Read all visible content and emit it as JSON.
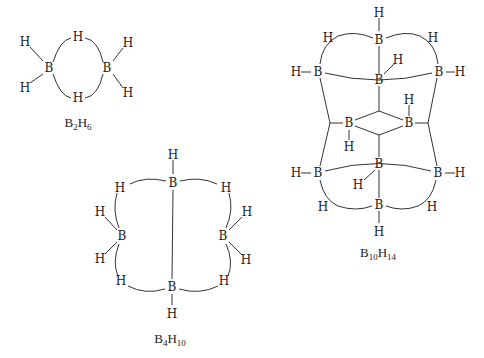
{
  "diagram": {
    "colors": {
      "ink": "#222222",
      "background": "#ffffff"
    },
    "molecules": [
      {
        "id": "b2h6",
        "formula": {
          "main1": "B",
          "sub1": "2",
          "main2": "H",
          "sub2": "6"
        },
        "atoms": [
          {
            "el": "B",
            "x": 49,
            "y": 68
          },
          {
            "el": "B",
            "x": 107,
            "y": 68
          },
          {
            "el": "H",
            "x": 78,
            "y": 37
          },
          {
            "el": "H",
            "x": 78,
            "y": 98
          },
          {
            "el": "H",
            "x": 25,
            "y": 42
          },
          {
            "el": "H",
            "x": 25,
            "y": 88
          },
          {
            "el": "H",
            "x": 128,
            "y": 43
          },
          {
            "el": "H",
            "x": 128,
            "y": 93
          }
        ]
      },
      {
        "id": "b4h10",
        "formula": {
          "main1": "B",
          "sub1": "4",
          "main2": "H",
          "sub2": "10"
        },
        "atoms": [
          {
            "el": "H",
            "x": 173,
            "y": 155
          },
          {
            "el": "B",
            "x": 173,
            "y": 183
          },
          {
            "el": "H",
            "x": 120,
            "y": 188
          },
          {
            "el": "H",
            "x": 226,
            "y": 188
          },
          {
            "el": "H",
            "x": 100,
            "y": 212
          },
          {
            "el": "B",
            "x": 122,
            "y": 236
          },
          {
            "el": "H",
            "x": 100,
            "y": 259
          },
          {
            "el": "H",
            "x": 247,
            "y": 212
          },
          {
            "el": "B",
            "x": 223,
            "y": 236
          },
          {
            "el": "H",
            "x": 246,
            "y": 260
          },
          {
            "el": "H",
            "x": 121,
            "y": 281
          },
          {
            "el": "H",
            "x": 224,
            "y": 281
          },
          {
            "el": "B",
            "x": 172,
            "y": 287
          },
          {
            "el": "H",
            "x": 172,
            "y": 314
          }
        ]
      },
      {
        "id": "b10h14",
        "formula": {
          "main1": "B",
          "sub1": "10",
          "main2": "H",
          "sub2": "14"
        },
        "atoms": [
          {
            "el": "H",
            "x": 379,
            "y": 13
          },
          {
            "el": "B",
            "x": 379,
            "y": 40
          },
          {
            "el": "H",
            "x": 328,
            "y": 38
          },
          {
            "el": "H",
            "x": 433,
            "y": 38
          },
          {
            "el": "H",
            "x": 296,
            "y": 72
          },
          {
            "el": "B",
            "x": 318,
            "y": 72
          },
          {
            "el": "B",
            "x": 379,
            "y": 80
          },
          {
            "el": "H",
            "x": 398,
            "y": 60
          },
          {
            "el": "B",
            "x": 439,
            "y": 72
          },
          {
            "el": "H",
            "x": 460,
            "y": 72
          },
          {
            "el": "B",
            "x": 349,
            "y": 123
          },
          {
            "el": "H",
            "x": 349,
            "y": 147
          },
          {
            "el": "B",
            "x": 409,
            "y": 123
          },
          {
            "el": "H",
            "x": 409,
            "y": 100
          },
          {
            "el": "H",
            "x": 296,
            "y": 173
          },
          {
            "el": "B",
            "x": 318,
            "y": 173
          },
          {
            "el": "B",
            "x": 379,
            "y": 164
          },
          {
            "el": "H",
            "x": 358,
            "y": 185
          },
          {
            "el": "B",
            "x": 438,
            "y": 173
          },
          {
            "el": "H",
            "x": 460,
            "y": 173
          },
          {
            "el": "H",
            "x": 323,
            "y": 207
          },
          {
            "el": "H",
            "x": 432,
            "y": 207
          },
          {
            "el": "B",
            "x": 379,
            "y": 205
          },
          {
            "el": "H",
            "x": 379,
            "y": 232
          }
        ]
      }
    ]
  }
}
